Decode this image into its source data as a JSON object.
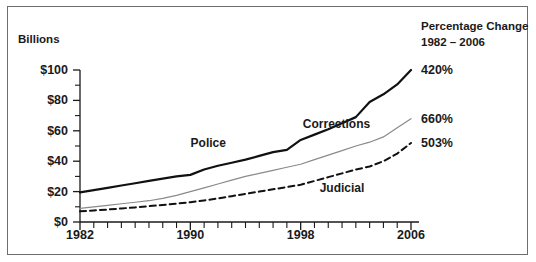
{
  "chart_data": {
    "type": "line",
    "title": "",
    "xlabel": "",
    "ylabel": "Billions",
    "ylim": [
      0,
      100
    ],
    "xlim": [
      1982,
      2006
    ],
    "grid": false,
    "legend_position": "inline-annotations",
    "y_tick_labels": [
      "$0",
      "$20",
      "$40",
      "$60",
      "$80",
      "$100"
    ],
    "y_tick_values": [
      0,
      20,
      40,
      60,
      80,
      100
    ],
    "y_minor_tick_values": [
      10,
      30,
      50,
      70,
      90
    ],
    "x_tick_labels": [
      "1982",
      "1990",
      "1998",
      "2006"
    ],
    "x_tick_values": [
      1982,
      1990,
      1998,
      2006
    ],
    "x_minor_tick_values": [
      1983,
      1984,
      1985,
      1986,
      1987,
      1988,
      1989,
      1991,
      1992,
      1993,
      1994,
      1995,
      1996,
      1997,
      1999,
      2000,
      2001,
      2002,
      2003,
      2004,
      2005
    ],
    "x": [
      1982,
      1983,
      1984,
      1985,
      1986,
      1987,
      1988,
      1989,
      1990,
      1991,
      1992,
      1993,
      1994,
      1995,
      1996,
      1997,
      1998,
      1999,
      2000,
      2001,
      2002,
      2003,
      2004,
      2005,
      2006
    ],
    "series": [
      {
        "name": "Police",
        "style": "solid-thick",
        "color": "#111111",
        "percent_change": "420%",
        "values": [
          19.5,
          21.0,
          22.5,
          24.0,
          25.5,
          27.0,
          28.5,
          30.0,
          31.0,
          34.5,
          37.0,
          39.0,
          41.0,
          43.5,
          46.0,
          47.5,
          54.0,
          57.5,
          61.0,
          65.0,
          69.0,
          79.0,
          84.0,
          90.5,
          100.0
        ]
      },
      {
        "name": "Corrections",
        "style": "solid-thin",
        "color": "#8a8a8a",
        "percent_change": "660%",
        "values": [
          9.0,
          10.0,
          11.0,
          12.0,
          13.0,
          14.0,
          15.5,
          17.5,
          20.0,
          22.5,
          25.0,
          27.5,
          30.0,
          32.0,
          34.0,
          36.0,
          38.0,
          41.0,
          44.0,
          47.0,
          50.0,
          52.5,
          56.0,
          62.0,
          68.0
        ]
      },
      {
        "name": "Judicial",
        "style": "dashed",
        "color": "#111111",
        "percent_change": "503%",
        "values": [
          7.0,
          7.6,
          8.2,
          8.9,
          9.6,
          10.4,
          11.2,
          12.1,
          13.0,
          14.2,
          15.5,
          17.0,
          18.5,
          20.0,
          21.5,
          23.0,
          24.5,
          27.0,
          29.5,
          32.0,
          34.5,
          36.5,
          40.0,
          45.0,
          52.0
        ]
      }
    ],
    "annotations": [
      {
        "text": "Police",
        "x": 1991.3,
        "y": 52.0
      },
      {
        "text": "Corrections",
        "x": 2000.6,
        "y": 64.5
      },
      {
        "text": "Judicial",
        "x": 2001.0,
        "y": 22.5
      }
    ]
  },
  "legend_panel": {
    "title_line1": "Percentage Change",
    "title_line2": "1982 – 2006",
    "entries": [
      {
        "label": "420%",
        "series": "Police"
      },
      {
        "label": "660%",
        "series": "Corrections"
      },
      {
        "label": "503%",
        "series": "Judicial"
      }
    ]
  }
}
